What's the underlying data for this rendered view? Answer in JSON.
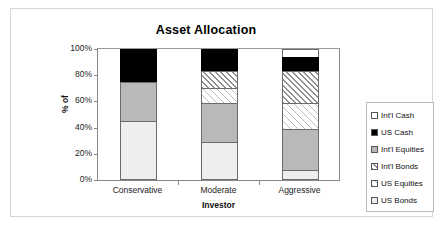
{
  "chart_data": {
    "type": "bar",
    "subtype": "stacked-bar-100",
    "title": "Asset Allocation",
    "xlabel": "Investor",
    "ylabel": "% of",
    "categories": [
      "Conservative",
      "Moderate",
      "Aggressive"
    ],
    "ylim": [
      0,
      100
    ],
    "yticks": [
      "0%",
      "20%",
      "40%",
      "60%",
      "80%",
      "100%"
    ],
    "ytick_values": [
      0,
      20,
      40,
      60,
      80,
      100
    ],
    "grid": false,
    "legend_position": "right",
    "stack_order_bottom_up": [
      "US Bonds",
      "Int'l Equities",
      "US Equities",
      "Int'l Bonds",
      "US Cash",
      "Int'l Cash"
    ],
    "series": [
      {
        "name": "Int'l Cash",
        "fill": "white",
        "values": [
          0,
          0,
          6
        ]
      },
      {
        "name": "US Cash",
        "fill": "solid-black",
        "values": [
          25,
          17,
          11
        ]
      },
      {
        "name": "Int'l Equities",
        "fill": "grey",
        "values": [
          30,
          30,
          31
        ]
      },
      {
        "name": "Int'l Bonds",
        "fill": "hatch-dense",
        "values": [
          0,
          13,
          24
        ]
      },
      {
        "name": "US Equities",
        "fill": "hatch-light",
        "values": [
          0,
          11,
          20
        ]
      },
      {
        "name": "US Bonds",
        "fill": "light-grey",
        "values": [
          45,
          29,
          8
        ]
      }
    ]
  },
  "legend": {
    "items": [
      {
        "label": "Int'l Cash",
        "swatch": "white-swatch-icon"
      },
      {
        "label": "US Cash",
        "swatch": "black-swatch-icon"
      },
      {
        "label": "Int'l Equities",
        "swatch": "grey-swatch-icon"
      },
      {
        "label": "Int'l Bonds",
        "swatch": "hatch-dense-swatch-icon"
      },
      {
        "label": "US Equities",
        "swatch": "hatch-light-swatch-icon"
      },
      {
        "label": "US Bonds",
        "swatch": "light-grey-swatch-icon"
      }
    ]
  },
  "colors": {
    "black": "#000000",
    "grey": "#b9b9b9",
    "light_grey": "#eeeeee",
    "frame": "#d6d6d6",
    "axis": "#888888"
  }
}
